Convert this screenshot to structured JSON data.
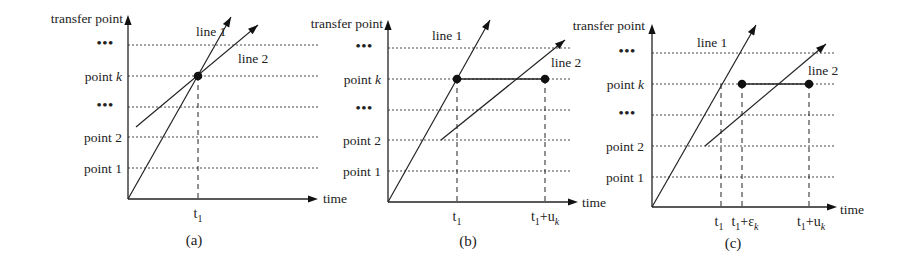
{
  "figure": {
    "width": 906,
    "height": 273,
    "y_axis_label": "transfer point",
    "x_axis_label": "time",
    "row_labels": [
      "...",
      "point k",
      "...",
      "point 2",
      "point 1"
    ],
    "line_labels": {
      "line1": "line 1",
      "line2": "line 2"
    },
    "panels": [
      {
        "id": "a",
        "caption": "(a)",
        "origin": [
          128,
          199
        ],
        "y_top": 15,
        "x_end": 318,
        "rows_y": [
          45,
          76,
          107,
          137,
          168
        ],
        "grid_x_end": 318,
        "label_right_x": 122,
        "y_axis_label_pos": [
          123,
          23
        ],
        "x_axis_label_pos": [
          323,
          203
        ],
        "line1": {
          "start": [
            128,
            199
          ],
          "tip": [
            231,
            17
          ],
          "label_pos": [
            196,
            36
          ]
        },
        "line2": {
          "start": [
            136,
            127
          ],
          "tip": [
            258,
            25
          ],
          "label_pos": [
            238,
            63
          ]
        },
        "dots": [
          [
            198,
            76
          ]
        ],
        "hsegments": [],
        "vdashes": [
          198
        ],
        "ticks": [
          {
            "x": 198,
            "text": "t",
            "sub": "1"
          }
        ],
        "caption_pos": [
          194,
          245
        ]
      },
      {
        "id": "b",
        "caption": "(b)",
        "origin": [
          388,
          202
        ],
        "y_top": 20,
        "x_end": 578,
        "rows_y": [
          48,
          79,
          110,
          140,
          171
        ],
        "grid_x_end": 572,
        "label_right_x": 381,
        "y_axis_label_pos": [
          383,
          28
        ],
        "x_axis_label_pos": [
          582,
          207
        ],
        "line1": {
          "start": [
            388,
            202
          ],
          "tip": [
            490,
            20
          ],
          "label_pos": [
            432,
            40
          ]
        },
        "line2": {
          "start": [
            441,
            140
          ],
          "tip": [
            565,
            40
          ],
          "label_pos": [
            551,
            67
          ]
        },
        "dots": [
          [
            457,
            79
          ],
          [
            545,
            79
          ]
        ],
        "hsegments": [
          [
            457,
            79,
            545,
            79
          ]
        ],
        "vdashes": [
          457,
          545
        ],
        "ticks": [
          {
            "x": 457,
            "text": "t",
            "sub": "1"
          },
          {
            "x": 545,
            "text": "t",
            "sub": "1",
            "tail": "+u",
            "tail_sub": "k"
          }
        ],
        "caption_pos": [
          468,
          246
        ]
      },
      {
        "id": "c",
        "caption": "(c)",
        "origin": [
          652,
          207
        ],
        "y_top": 24,
        "x_end": 837,
        "rows_y": [
          53,
          84,
          115,
          146,
          177
        ],
        "grid_x_end": 834,
        "label_right_x": 644,
        "y_axis_label_pos": [
          645,
          30
        ],
        "x_axis_label_pos": [
          840,
          214
        ],
        "line1": {
          "start": [
            652,
            207
          ],
          "tip": [
            756,
            25
          ],
          "label_pos": [
            697,
            47
          ]
        },
        "line2": {
          "start": [
            705,
            146
          ],
          "tip": [
            826,
            44
          ],
          "label_pos": [
            808,
            75
          ]
        },
        "dots": [
          [
            742,
            84
          ],
          [
            809,
            84
          ]
        ],
        "hsegments": [
          [
            742,
            84,
            809,
            84
          ]
        ],
        "vdashes": [
          721,
          742,
          809
        ],
        "ticks": [
          {
            "x": 719,
            "text": "t",
            "sub": "1"
          },
          {
            "x": 745,
            "text": "t",
            "sub": "1",
            "tail": "+ε",
            "tail_sub": "k"
          },
          {
            "x": 811,
            "text": "t",
            "sub": "1",
            "tail": "+u",
            "tail_sub": "k"
          }
        ],
        "caption_pos": [
          733,
          248
        ]
      }
    ]
  }
}
